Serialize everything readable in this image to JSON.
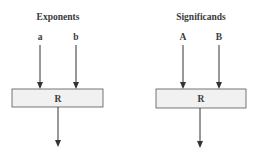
{
  "panels": [
    {
      "title": "Exponents",
      "inputs": [
        "a",
        "b"
      ],
      "box_label": "R"
    },
    {
      "title": "Significands",
      "inputs": [
        "A",
        "B"
      ],
      "box_label": "R"
    }
  ],
  "colors": {
    "box_fill": "#f1f1f1",
    "stroke": "#333333",
    "text": "#3a3a3a"
  }
}
